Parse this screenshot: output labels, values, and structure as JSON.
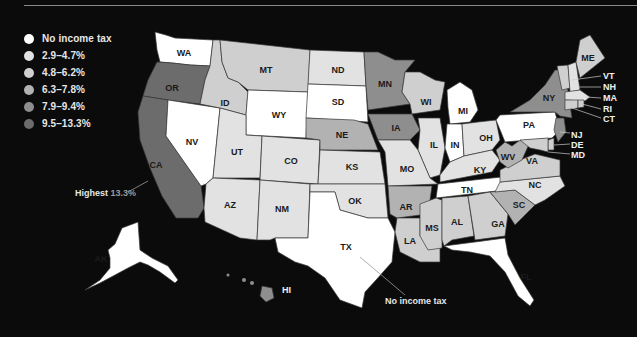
{
  "colors": {
    "background": "#0b0b0b",
    "no_tax": "#ffffff",
    "tier1": "#e2e2e2",
    "tier2": "#cfcfcf",
    "tier3": "#b2b2b2",
    "tier4": "#8e8e8e",
    "tier5": "#6c6c6c",
    "highlight_text": "#9a9a9a"
  },
  "legend": [
    {
      "label": "No income tax",
      "color": "#ffffff"
    },
    {
      "label": "2.9–4.7%",
      "color": "#e2e2e2"
    },
    {
      "label": "4.8–6.2%",
      "color": "#cfcfcf"
    },
    {
      "label": "6.3–7.8%",
      "color": "#b2b2b2"
    },
    {
      "label": "7.9–9.4%",
      "color": "#8e8e8e"
    },
    {
      "label": "9.5–13.3%",
      "color": "#6c6c6c"
    }
  ],
  "annotations": {
    "highest_label": "Highest",
    "highest_value": "13.3%",
    "no_income_tax": "No income tax"
  },
  "states": {
    "WA": "WA",
    "OR": "OR",
    "CA": "CA",
    "ID": "ID",
    "NV": "NV",
    "MT": "MT",
    "WY": "WY",
    "UT": "UT",
    "AZ": "AZ",
    "CO": "CO",
    "NM": "NM",
    "ND": "ND",
    "SD": "SD",
    "NE": "NE",
    "KS": "KS",
    "OK": "OK",
    "TX": "TX",
    "MN": "MN",
    "IA": "IA",
    "MO": "MO",
    "AR": "AR",
    "LA": "LA",
    "WI": "WI",
    "IL": "IL",
    "MI": "MI",
    "IN": "IN",
    "OH": "OH",
    "KY": "KY",
    "TN": "TN",
    "MS": "MS",
    "AL": "AL",
    "GA": "GA",
    "FL": "FL",
    "SC": "SC",
    "NC": "NC",
    "VA": "VA",
    "WV": "WV",
    "PA": "PA",
    "NY": "NY",
    "ME": "ME",
    "VT": "VT",
    "NH": "NH",
    "MA": "MA",
    "RI": "RI",
    "CT": "CT",
    "NJ": "NJ",
    "DE": "DE",
    "MD": "MD",
    "AK": "AK",
    "HI": "HI"
  }
}
